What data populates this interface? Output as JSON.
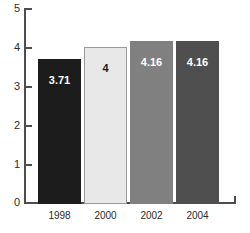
{
  "chart_data": {
    "type": "bar",
    "title": "",
    "subtitle": "",
    "xlabel": "",
    "ylabel": "",
    "categories": [
      "1998",
      "2000",
      "2002",
      "2004"
    ],
    "values": [
      3.71,
      4,
      4.16,
      4.16
    ],
    "value_labels": [
      "3.71",
      "4",
      "4.16",
      "4.16"
    ],
    "bar_colors": [
      "#1c1c1c",
      "#e8e8e8",
      "#808080",
      "#4f4f4f"
    ],
    "bar_label_colors": [
      "#ffffff",
      "#1c1c1c",
      "#ffffff",
      "#ffffff"
    ],
    "bar_border_colors": [
      "#1c1c1c",
      "#9a9a9a",
      "#808080",
      "#4f4f4f"
    ],
    "ylim": [
      0,
      5
    ],
    "yticks": [
      0,
      1,
      2,
      3,
      4,
      5
    ],
    "ytick_labels": [
      "0",
      "1",
      "2",
      "3",
      "4",
      "5"
    ],
    "grid": false,
    "legend": false,
    "legend_position": "none",
    "axis_color": "#4d4d4d",
    "background_color": "#ffffff"
  }
}
